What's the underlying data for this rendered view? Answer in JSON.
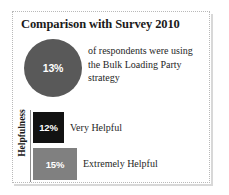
{
  "chart_data": {
    "type": "bar",
    "title": "Comparison with Survey 2010",
    "xlabel": "",
    "ylabel": "Helpfulness",
    "categories": [
      "Very Helpful",
      "Extremely Helpful"
    ],
    "values": [
      12,
      15
    ],
    "value_labels": [
      "12%",
      "15%"
    ],
    "unit": "%",
    "grid": false,
    "legend": "none",
    "series": [
      {
        "name": "Helpfulness",
        "categories": [
          "Very Helpful",
          "Extremely Helpful"
        ],
        "values": [
          12,
          15
        ],
        "colors": [
          "#121212",
          "#808080"
        ]
      }
    ],
    "callout": {
      "type": "pie",
      "value": 13,
      "value_label": "13%",
      "color": "#595959",
      "annotation": "of respondents were using the Bulk Loading Party strategy"
    }
  },
  "panel": {
    "title": "Comparison with Survey 2010",
    "border_color": "#b9b9b9",
    "background": "#ffffff"
  },
  "pie_stat": {
    "value_label": "13%",
    "fill_color": "#595959",
    "text_lines": [
      "of respondents were using",
      "the Bulk Loading Party",
      "strategy"
    ]
  },
  "bar_chart": {
    "axis_label": "Helpfulness",
    "bars": [
      {
        "value_label": "12%",
        "category": "Very Helpful",
        "color": "#121212"
      },
      {
        "value_label": "15%",
        "category": "Extremely Helpful",
        "color": "#808080"
      }
    ]
  }
}
